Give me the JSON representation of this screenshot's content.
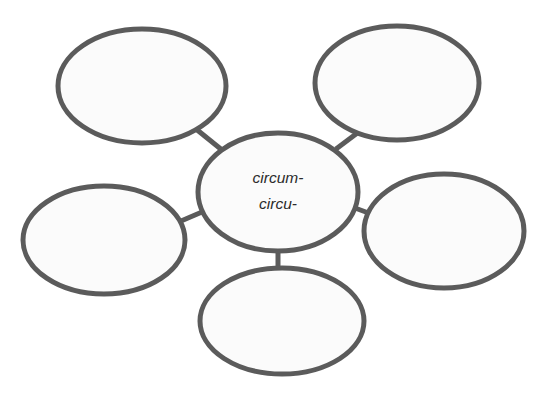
{
  "diagram": {
    "type": "word-web",
    "background_color": "#ffffff",
    "stroke_color": "#5b5b5b",
    "fill_color": "#fbfbfb",
    "text_color": "#2b2b2b",
    "center": {
      "id": "center",
      "label_line_1": "circum-",
      "label_line_2": "circu-",
      "cx": 278,
      "cy": 192,
      "rx": 80,
      "ry": 59
    },
    "branches": [
      {
        "id": "top-left",
        "label": "",
        "cx": 142,
        "cy": 86,
        "rx": 84,
        "ry": 57
      },
      {
        "id": "top-right",
        "label": "",
        "cx": 397,
        "cy": 83,
        "rx": 82,
        "ry": 57
      },
      {
        "id": "right",
        "label": "",
        "cx": 444,
        "cy": 231,
        "rx": 80,
        "ry": 57
      },
      {
        "id": "bottom",
        "label": "",
        "cx": 282,
        "cy": 321,
        "rx": 82,
        "ry": 53
      },
      {
        "id": "left",
        "label": "",
        "cx": 104,
        "cy": 240,
        "rx": 81,
        "ry": 54
      }
    ],
    "connectors": [
      {
        "id": "center-to-top-left",
        "x1": 222,
        "y1": 150,
        "x2": 196,
        "y2": 129
      },
      {
        "id": "center-to-top-right",
        "x1": 336,
        "y1": 149,
        "x2": 364,
        "y2": 128
      },
      {
        "id": "center-to-right",
        "x1": 355,
        "y1": 208,
        "x2": 382,
        "y2": 218
      },
      {
        "id": "center-to-bottom",
        "x1": 278,
        "y1": 248,
        "x2": 278,
        "y2": 272
      },
      {
        "id": "center-to-left",
        "x1": 202,
        "y1": 212,
        "x2": 174,
        "y2": 224
      }
    ]
  }
}
